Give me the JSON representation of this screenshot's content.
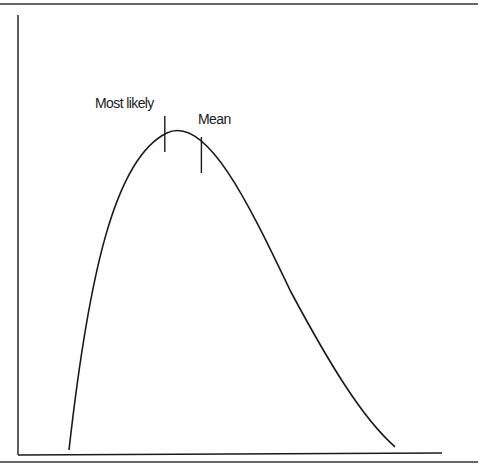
{
  "chart_data": {
    "type": "line",
    "title": "",
    "xlabel": "",
    "ylabel": "",
    "grid": false,
    "curve": {
      "name": "distribution",
      "x": [
        0,
        0.1,
        0.2,
        0.3,
        0.4,
        0.5,
        0.6,
        0.7,
        0.8,
        0.9,
        1.0
      ],
      "y": [
        0,
        0.62,
        0.9,
        1.0,
        0.93,
        0.78,
        0.61,
        0.44,
        0.28,
        0.13,
        0
      ],
      "peak_x": 0.3
    },
    "markers": [
      {
        "label": "Most likely",
        "x": 0.3
      },
      {
        "label": "Mean",
        "x": 0.4
      }
    ],
    "colors": {
      "line": "#1a1a1a",
      "background": "#ffffff"
    }
  }
}
